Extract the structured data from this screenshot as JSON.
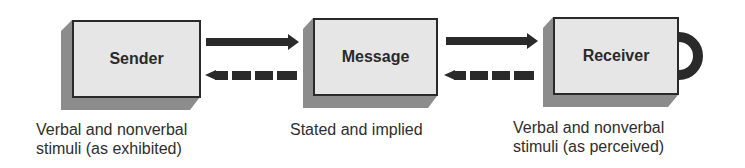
{
  "diagram": {
    "type": "communication-model",
    "nodes": [
      {
        "id": "sender",
        "label": "Sender",
        "caption_line1": "Verbal and nonverbal",
        "caption_line2": "stimuli (as exhibited)"
      },
      {
        "id": "message",
        "label": "Message",
        "caption_line1": "Stated and implied",
        "caption_line2": ""
      },
      {
        "id": "receiver",
        "label": "Receiver",
        "caption_line1": "Verbal and nonverbal",
        "caption_line2": "stimuli (as perceived)"
      }
    ],
    "edges": [
      {
        "from": "sender",
        "to": "message",
        "style": "solid"
      },
      {
        "from": "message",
        "to": "sender",
        "style": "dashed"
      },
      {
        "from": "message",
        "to": "receiver",
        "style": "solid"
      },
      {
        "from": "receiver",
        "to": "message",
        "style": "dashed"
      },
      {
        "from": "receiver",
        "to": "receiver",
        "style": "loop"
      }
    ],
    "colors": {
      "box_face": "#e6e6e6",
      "box_shadow": "#8c8c8c",
      "arrow": "#2a2a2a"
    }
  }
}
